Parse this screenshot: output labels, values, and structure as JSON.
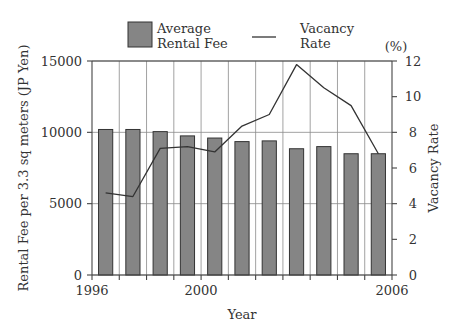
{
  "chart_data": {
    "type": "bar",
    "title": "",
    "xlabel": "Year",
    "ylabel": "Rental Fee per 3.3 sq meters (JP Yen)",
    "y2label": "Vacancy Rate",
    "y2unit": "(%)",
    "categories": [
      "1996",
      "1997",
      "1998",
      "1999",
      "2000",
      "2001",
      "2002",
      "2003",
      "2004",
      "2005",
      "2006"
    ],
    "x_tick_labels": [
      {
        "index": 0,
        "label": "1996"
      },
      {
        "index": 4,
        "label": "2000"
      },
      {
        "index": 11,
        "label": "2006"
      }
    ],
    "ylim": [
      0,
      15000
    ],
    "yticks": [
      0,
      5000,
      10000,
      15000
    ],
    "y2lim": [
      0,
      12
    ],
    "y2ticks": [
      0,
      2,
      4,
      6,
      8,
      10,
      12
    ],
    "grid": true,
    "legend_position": "top",
    "series": [
      {
        "name": "Average Rental Fee",
        "legend_label": [
          "Average",
          "Rental Fee"
        ],
        "type": "bar",
        "axis": "left",
        "color": "#858585",
        "values": [
          10200,
          10200,
          10050,
          9750,
          9600,
          9350,
          9400,
          8850,
          9000,
          8500,
          8500
        ]
      },
      {
        "name": "Vacancy Rate",
        "legend_label": [
          "Vacancy",
          "Rate"
        ],
        "type": "line",
        "axis": "right",
        "color": "#333333",
        "values": [
          4.6,
          4.4,
          7.1,
          7.2,
          6.9,
          8.35,
          9.0,
          11.8,
          10.5,
          9.5,
          6.8
        ]
      }
    ]
  }
}
